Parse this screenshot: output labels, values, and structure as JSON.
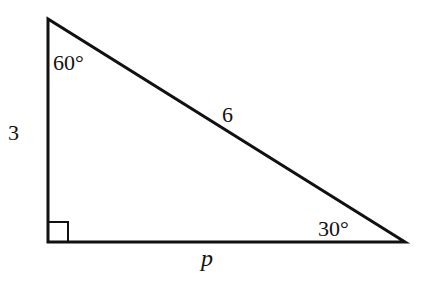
{
  "diagram": {
    "type": "right-triangle",
    "vertices": {
      "top": {
        "x": 48,
        "y": 19,
        "angle": "60°"
      },
      "right_angle": {
        "x": 48,
        "y": 242,
        "angle": "90°"
      },
      "right": {
        "x": 405,
        "y": 242,
        "angle": "30°"
      }
    },
    "labels": {
      "angle_top": "60°",
      "angle_right": "30°",
      "side_vertical": "3",
      "side_hypotenuse": "6",
      "side_base": "p"
    },
    "colors": {
      "stroke": "#111111",
      "background": "#ffffff"
    }
  }
}
